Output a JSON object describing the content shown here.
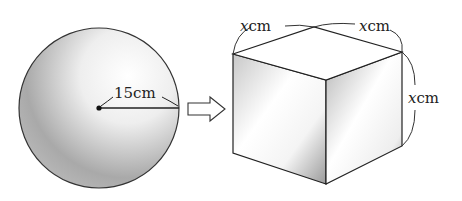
{
  "diagram": {
    "sphere": {
      "radius_label": "15cm",
      "radius_value": 15,
      "unit": "cm"
    },
    "arrow": {
      "direction": "right"
    },
    "cube": {
      "edge_labels": [
        {
          "var": "x",
          "unit": "cm",
          "position": "top-left"
        },
        {
          "var": "x",
          "unit": "cm",
          "position": "top-right"
        },
        {
          "var": "x",
          "unit": "cm",
          "position": "right"
        }
      ]
    },
    "colors": {
      "stroke": "#222222",
      "shade_dark": "#8a8a8a",
      "shade_light": "#ffffff"
    }
  }
}
